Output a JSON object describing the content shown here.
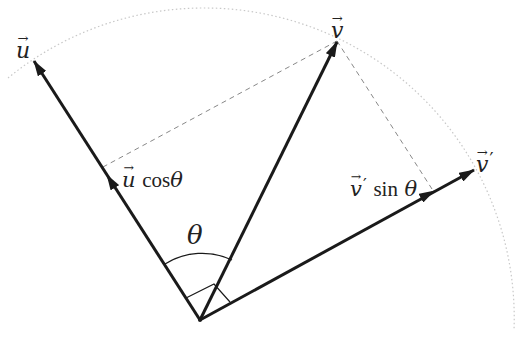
{
  "diagram": {
    "origin": {
      "x": 200,
      "y": 320
    },
    "arc": {
      "radius": 310,
      "style": "dotted",
      "color": "#cccccc"
    },
    "vectors": [
      {
        "id": "u",
        "label": "u",
        "tip": {
          "x": 33,
          "y": 60
        }
      },
      {
        "id": "v",
        "label": "v",
        "tip": {
          "x": 337,
          "y": 41
        }
      },
      {
        "id": "v_prime",
        "label": "v′",
        "tip": {
          "x": 474,
          "y": 170
        }
      }
    ],
    "components": [
      {
        "id": "u_cos",
        "label_vec": "u",
        "label_text": "cos",
        "label_angle": "θ",
        "tip": {
          "x": 107,
          "y": 176
        }
      },
      {
        "id": "v_sin",
        "label_vec": "v",
        "label_text": "sin",
        "label_angle": "θ",
        "tip": {
          "x": 434,
          "y": 192
        }
      }
    ],
    "projection_lines": [
      {
        "from": {
          "x": 337,
          "y": 41
        },
        "to": {
          "x": 103,
          "y": 168
        },
        "style": "dashed"
      },
      {
        "from": {
          "x": 337,
          "y": 41
        },
        "to": {
          "x": 432,
          "y": 189
        },
        "style": "dashed"
      }
    ],
    "angle_label": "θ",
    "right_angle_marker": true,
    "colors": {
      "vector": "#1a1a1a",
      "dashed": "#888888",
      "arc": "#cccccc"
    }
  },
  "labels": {
    "u": "u",
    "v": "v",
    "v_prime": "v",
    "prime_mark": "′",
    "u_cos_vec": "u",
    "cos": "cos",
    "theta": "θ",
    "v_sin_vec": "v",
    "sin": "sin",
    "angle": "θ"
  }
}
